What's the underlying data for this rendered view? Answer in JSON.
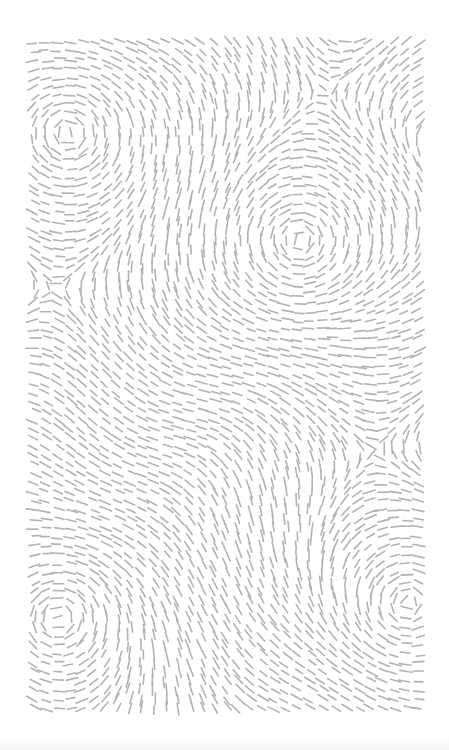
{
  "artwork": {
    "description": "Flow-field pattern of short gray dashes with swirling vortices",
    "background": "#ffffff",
    "dash_color": "#b3b3b3",
    "dash_length": 11,
    "dash_width": 1.6,
    "spacing": 9,
    "region": {
      "x0": 34,
      "y0": 42,
      "x1": 420,
      "y1": 714
    },
    "vortices": [
      {
        "x": 68,
        "y": 133,
        "strength": 1
      },
      {
        "x": 300,
        "y": 240,
        "strength": -1
      },
      {
        "x": 58,
        "y": 618,
        "strength": 1
      },
      {
        "x": 408,
        "y": 603,
        "strength": -1
      }
    ]
  }
}
